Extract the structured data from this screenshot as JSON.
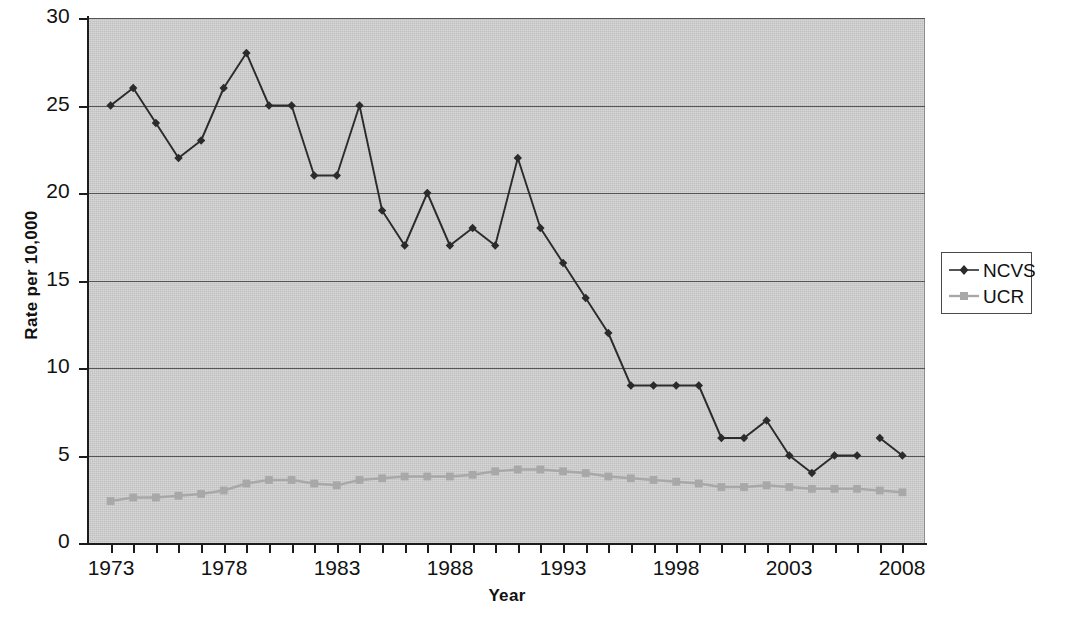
{
  "chart_data": {
    "type": "line",
    "title": "",
    "xlabel": "Year",
    "ylabel": "Rate per 10,000",
    "xlim": [
      1972,
      2009
    ],
    "ylim": [
      0,
      30
    ],
    "y_ticks": [
      0,
      5,
      10,
      15,
      20,
      25,
      30
    ],
    "x_ticks": [
      1973,
      1974,
      1975,
      1976,
      1977,
      1978,
      1979,
      1980,
      1981,
      1982,
      1983,
      1984,
      1985,
      1986,
      1987,
      1988,
      1989,
      1990,
      1991,
      1992,
      1993,
      1994,
      1995,
      1996,
      1997,
      1998,
      1999,
      2000,
      2001,
      2002,
      2003,
      2004,
      2005,
      2006,
      2007,
      2008
    ],
    "x_tick_labels": [
      "1973",
      "1978",
      "1983",
      "1988",
      "1993",
      "1998",
      "2003",
      "2008"
    ],
    "x_tick_label_years": [
      1973,
      1978,
      1983,
      1988,
      1993,
      1998,
      2003,
      2008
    ],
    "grid": "horizontal",
    "legend_position": "right",
    "plot_background": "#c9c9c9",
    "x": [
      1973,
      1974,
      1975,
      1976,
      1977,
      1978,
      1979,
      1980,
      1981,
      1982,
      1983,
      1984,
      1985,
      1986,
      1987,
      1988,
      1989,
      1990,
      1991,
      1992,
      1993,
      1994,
      1995,
      1996,
      1997,
      1998,
      1999,
      2000,
      2001,
      2002,
      2003,
      2004,
      2005,
      2006,
      2007,
      2008
    ],
    "series": [
      {
        "name": "NCVS",
        "color": "#2b2b2b",
        "marker": "diamond",
        "break_after_year": 2006,
        "values": [
          25,
          26,
          24,
          22,
          23,
          26,
          28,
          25,
          25,
          21,
          21,
          25,
          19,
          17,
          20,
          17,
          18,
          17,
          22,
          18,
          16,
          14,
          12,
          9,
          9,
          9,
          9,
          6,
          6,
          7,
          5,
          4,
          5,
          5,
          6,
          5
        ]
      },
      {
        "name": "UCR",
        "color": "#a8a8a8",
        "marker": "square",
        "break_after_year": null,
        "values": [
          2.4,
          2.6,
          2.6,
          2.7,
          2.8,
          3.0,
          3.4,
          3.6,
          3.6,
          3.4,
          3.3,
          3.6,
          3.7,
          3.8,
          3.8,
          3.8,
          3.9,
          4.1,
          4.2,
          4.2,
          4.1,
          4.0,
          3.8,
          3.7,
          3.6,
          3.5,
          3.4,
          3.2,
          3.2,
          3.3,
          3.2,
          3.1,
          3.1,
          3.1,
          3.0,
          2.9
        ]
      }
    ]
  },
  "legend": {
    "entries": [
      {
        "label": "NCVS"
      },
      {
        "label": "UCR"
      }
    ]
  },
  "axes": {
    "x_title": "Year",
    "y_title": "Rate per 10,000"
  }
}
